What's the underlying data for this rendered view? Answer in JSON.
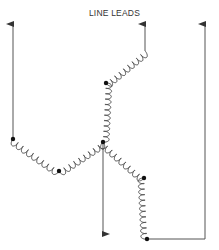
{
  "diagram": {
    "title": "LINE LEADS",
    "type": "three-phase wye (star) winding connection",
    "colors": {
      "line": "#555555",
      "node": "#111111",
      "background": "#ffffff"
    },
    "nodes": [
      {
        "id": "left-node",
        "x": 13,
        "y": 139
      },
      {
        "id": "bottom-left-node",
        "x": 59,
        "y": 171
      },
      {
        "id": "center-node",
        "x": 103,
        "y": 142
      },
      {
        "id": "upper-node",
        "x": 106,
        "y": 83
      },
      {
        "id": "right-mid-node",
        "x": 144,
        "y": 178
      },
      {
        "id": "bottom-right-node",
        "x": 147,
        "y": 239
      }
    ],
    "leads": [
      {
        "id": "left-lead",
        "direction": "up"
      },
      {
        "id": "top-lead",
        "direction": "up"
      },
      {
        "id": "right-lead",
        "direction": "up"
      },
      {
        "id": "neutral-lead",
        "direction": "down"
      }
    ]
  }
}
